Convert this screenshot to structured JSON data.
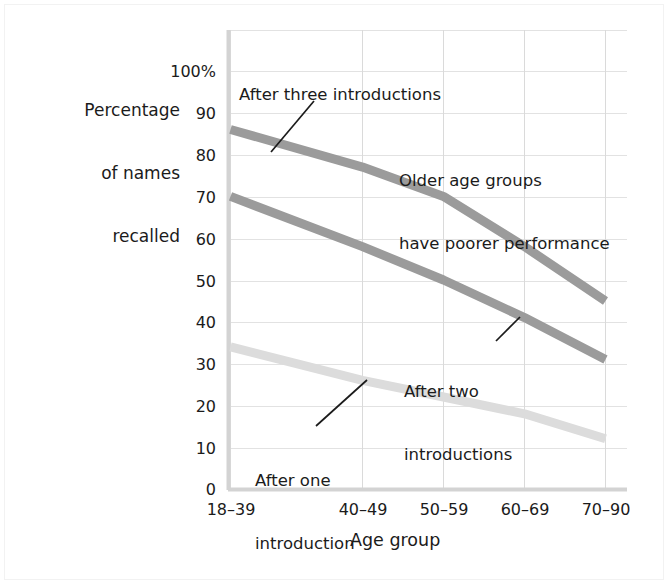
{
  "figure": {
    "background_color": "#ffffff",
    "frame_color": "#f2f2f2"
  },
  "chart_data": {
    "type": "line",
    "title": "",
    "xlabel": "Age group",
    "ylabel": "Percentage of names recalled",
    "categories": [
      "18–39",
      "40–49",
      "50–59",
      "60–69",
      "70–90"
    ],
    "ylim": [
      0,
      100
    ],
    "yticks": [
      0,
      10,
      20,
      30,
      40,
      50,
      60,
      70,
      80,
      90,
      100
    ],
    "ytick_labels": [
      "0",
      "10",
      "20",
      "30",
      "40",
      "50",
      "60",
      "70",
      "80",
      "90",
      "100%"
    ],
    "grid": true,
    "legend": "inline-annotations",
    "series": [
      {
        "name": "After three introductions",
        "color": "#9b9b9b",
        "values": [
          86,
          77,
          70,
          58,
          45
        ]
      },
      {
        "name": "After two introductions",
        "color": "#9b9b9b",
        "values": [
          70,
          58,
          50,
          41,
          31
        ]
      },
      {
        "name": "After one introduction",
        "color": "#dcdcdc",
        "values": [
          34,
          26,
          22,
          18,
          12
        ]
      }
    ],
    "annotations": [
      {
        "id": "after-three",
        "text": "After three introductions",
        "lines": [
          "After three introductions"
        ]
      },
      {
        "id": "after-two",
        "text": "After two introductions",
        "lines": [
          "After two",
          "introductions"
        ]
      },
      {
        "id": "after-one",
        "text": "After one introduction",
        "lines": [
          "After one",
          "introduction"
        ]
      },
      {
        "id": "takeaway",
        "text": "Older age groups have poorer performance",
        "lines": [
          "Older age groups",
          "have poorer performance"
        ]
      }
    ]
  },
  "labels": {
    "y_axis_title_line1": "Percentage",
    "y_axis_title_line2": "of names",
    "y_axis_title_line3": "recalled",
    "x_axis_title": "Age group",
    "y_100": "100%",
    "y_90": "90",
    "y_80": "80",
    "y_70": "70",
    "y_60": "60",
    "y_50": "50",
    "y_40": "40",
    "y_30": "30",
    "y_20": "20",
    "y_10": "10",
    "y_0": "0",
    "x_1": "18–39",
    "x_2": "40–49",
    "x_3": "50–59",
    "x_4": "60–69",
    "x_5": "70–90",
    "annot_three": "After three introductions",
    "annot_takeaway_l1": "Older age groups",
    "annot_takeaway_l2": "have poorer performance",
    "annot_two_l1": "After two",
    "annot_two_l2": "introductions",
    "annot_one_l1": "After one",
    "annot_one_l2": "introduction"
  }
}
